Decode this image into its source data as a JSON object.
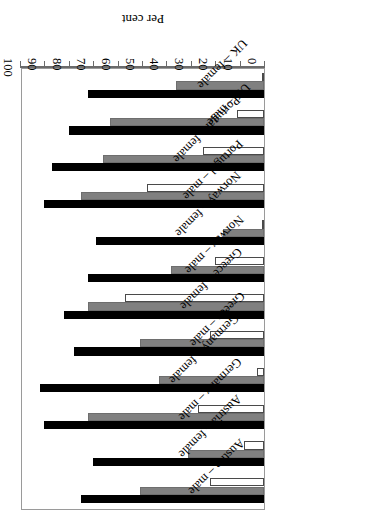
{
  "chart_data": {
    "type": "bar",
    "orientation": "horizontal",
    "title": "",
    "xlabel": "Per cent",
    "ylabel": "",
    "xlim": [
      0,
      100
    ],
    "tick_labels": [
      "0",
      "10",
      "20",
      "30",
      "40",
      "50",
      "60",
      "70",
      "80",
      "90",
      "100"
    ],
    "tick_values": [
      0,
      10,
      20,
      30,
      40,
      50,
      60,
      70,
      80,
      90,
      100
    ],
    "grid": false,
    "legend": "none",
    "rotation_note": "figure rendered upside-down (180 degrees)",
    "categories": [
      "Austria – male",
      "Austria – female",
      "Germany – male",
      "Germany – female",
      "Greece – male",
      "Greece – female",
      "Norway – male",
      "Norway – female",
      "Portugal – male",
      "Portugal – female",
      "UK – male",
      "UK – female"
    ],
    "series": [
      {
        "name": "series-black",
        "color": "#000000",
        "values": [
          75,
          70,
          90,
          92,
          78,
          82,
          72,
          69,
          90,
          87,
          80,
          72
        ]
      },
      {
        "name": "series-grey",
        "color": "#808080",
        "values": [
          51,
          31,
          72,
          43,
          51,
          72,
          38,
          17,
          75,
          66,
          63,
          36
        ]
      },
      {
        "name": "series-white",
        "color": "#ffffff",
        "values": [
          22,
          8,
          27,
          3,
          22,
          57,
          20,
          1,
          48,
          25,
          11,
          1
        ]
      }
    ]
  }
}
